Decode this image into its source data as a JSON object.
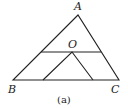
{
  "figure": {
    "caption": "(a)",
    "labels": {
      "A": "A",
      "B": "B",
      "C": "C",
      "O": "O"
    },
    "stroke_color": "#222222"
  }
}
